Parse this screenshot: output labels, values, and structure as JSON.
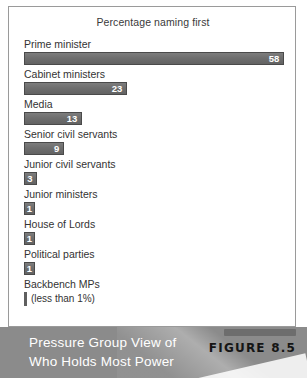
{
  "chart_data": {
    "type": "bar",
    "title": "Percentage naming first",
    "xlabel": "",
    "ylabel": "",
    "orientation": "horizontal",
    "xlim": [
      0,
      62
    ],
    "grid": false,
    "legend": null,
    "categories": [
      "Prime minister",
      "Cabinet ministers",
      "Media",
      "Senior civil servants",
      "Junior civil servants",
      "Junior ministers",
      "House of Lords",
      "Political parties",
      "Backbench MPs"
    ],
    "values": [
      58,
      23,
      13,
      9,
      3,
      1,
      1,
      1,
      0.4
    ],
    "value_labels": [
      "58",
      "23",
      "13",
      "9",
      "3",
      "1",
      "1",
      "1",
      ""
    ],
    "annotations": [
      "(less than 1%)"
    ],
    "bar_color": "#6e6e6e",
    "bar_border_color": "#4a4a4a"
  },
  "panel": {
    "title": "Percentage naming first",
    "rows": [
      {
        "label": "Prime minister",
        "value": "58",
        "pct": 58,
        "sliver": false,
        "note": ""
      },
      {
        "label": "Cabinet ministers",
        "value": "23",
        "pct": 23,
        "sliver": false,
        "note": ""
      },
      {
        "label": "Media",
        "value": "13",
        "pct": 13,
        "sliver": false,
        "note": ""
      },
      {
        "label": "Senior civil servants",
        "value": "9",
        "pct": 9,
        "sliver": false,
        "note": ""
      },
      {
        "label": "Junior civil servants",
        "value": "3",
        "pct": 3,
        "sliver": false,
        "note": ""
      },
      {
        "label": "Junior ministers",
        "value": "1",
        "pct": 1,
        "sliver": false,
        "note": ""
      },
      {
        "label": "House of Lords",
        "value": "1",
        "pct": 1,
        "sliver": false,
        "note": ""
      },
      {
        "label": "Political parties",
        "value": "1",
        "pct": 1,
        "sliver": false,
        "note": ""
      },
      {
        "label": "Backbench MPs",
        "value": "",
        "pct": 0.4,
        "sliver": true,
        "note": "(less than 1%)"
      }
    ]
  },
  "caption": {
    "line1": "Pressure Group View of",
    "line2": "Who Holds Most Power",
    "figure_label": "FIGURE 8.5"
  },
  "colors": {
    "bar_fill": "#6e6e6e",
    "bar_border": "#4a4a4a",
    "caption_band": "#8b8b8b",
    "panel_border": "#9a9a9a",
    "text": "#333333",
    "caption_text": "#ffffff",
    "figure_label": "#151515"
  }
}
